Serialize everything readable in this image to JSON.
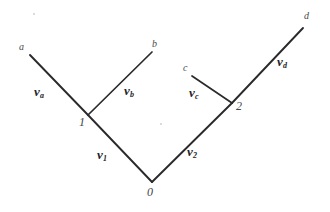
{
  "figure": {
    "type": "tree-diagram",
    "background_color": "#ffffff",
    "line_color": "#2a2a2c",
    "label_color": "#232327"
  },
  "nodes": [
    {
      "id": "0",
      "label": "0",
      "x": 152,
      "y": 182,
      "label_x": 147,
      "label_y": 186,
      "role": "root"
    },
    {
      "id": "1",
      "label": "1",
      "x": 88,
      "y": 115,
      "label_x": 79,
      "label_y": 116,
      "role": "internal"
    },
    {
      "id": "2",
      "label": "2",
      "x": 232,
      "y": 103,
      "label_x": 236,
      "label_y": 100,
      "role": "internal"
    }
  ],
  "leaves": [
    {
      "id": "a",
      "label": "a",
      "x": 30,
      "y": 55,
      "label_x": 19,
      "label_y": 42
    },
    {
      "id": "b",
      "label": "b",
      "x": 152,
      "y": 52,
      "label_x": 152,
      "label_y": 39
    },
    {
      "id": "c",
      "label": "c",
      "x": 192,
      "y": 76,
      "label_x": 183,
      "label_y": 63
    },
    {
      "id": "d",
      "label": "d",
      "x": 303,
      "y": 28,
      "label_x": 304,
      "label_y": 11
    }
  ],
  "edges": [
    {
      "id": "edge-root-1",
      "from": "0",
      "to": "1",
      "x1": 152,
      "y1": 182,
      "x2": 88,
      "y2": 115
    },
    {
      "id": "edge-root-2",
      "from": "0",
      "to": "2",
      "x1": 152,
      "y1": 182,
      "x2": 232,
      "y2": 103
    },
    {
      "id": "edge-1-a",
      "from": "1",
      "to": "a",
      "x1": 88,
      "y1": 115,
      "x2": 30,
      "y2": 55
    },
    {
      "id": "edge-1-b",
      "from": "1",
      "to": "b",
      "x1": 88,
      "y1": 115,
      "x2": 152,
      "y2": 52
    },
    {
      "id": "edge-2-c",
      "from": "2",
      "to": "c",
      "x1": 232,
      "y1": 103,
      "x2": 192,
      "y2": 76
    },
    {
      "id": "edge-2-d",
      "from": "2",
      "to": "d",
      "x1": 232,
      "y1": 103,
      "x2": 303,
      "y2": 28
    }
  ],
  "vector_labels": [
    {
      "id": "v1",
      "base": "v",
      "sub": "1",
      "edge": "edge-root-1",
      "x": 97,
      "y": 148
    },
    {
      "id": "v2",
      "base": "v",
      "sub": "2",
      "edge": "edge-root-2",
      "x": 187,
      "y": 145
    },
    {
      "id": "va",
      "base": "v",
      "sub": "a",
      "edge": "edge-1-a",
      "x": 34,
      "y": 85
    },
    {
      "id": "vb",
      "base": "v",
      "sub": "b",
      "edge": "edge-1-b",
      "x": 124,
      "y": 84
    },
    {
      "id": "vc",
      "base": "v",
      "sub": "c",
      "edge": "edge-2-c",
      "x": 189,
      "y": 86
    },
    {
      "id": "vd",
      "base": "v",
      "sub": "d",
      "edge": "edge-2-d",
      "x": 277,
      "y": 55
    }
  ],
  "speckles": [
    {
      "x": 160,
      "y": 123,
      "size": 2
    },
    {
      "x": 33,
      "y": 13,
      "size": 2
    }
  ]
}
